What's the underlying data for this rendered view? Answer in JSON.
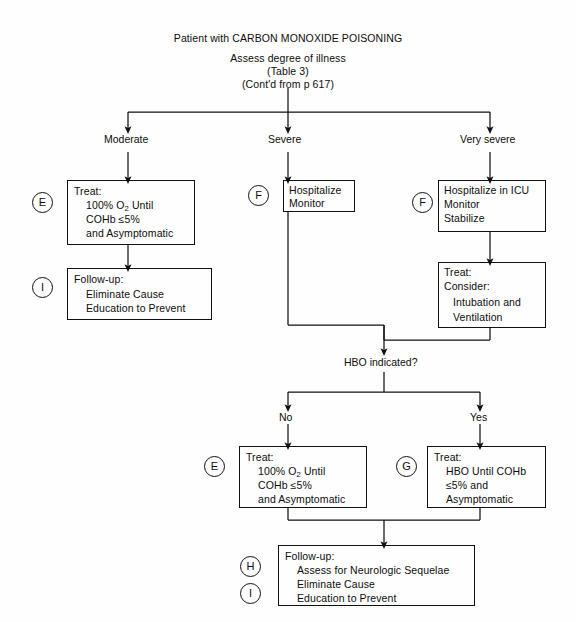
{
  "diagram": {
    "title": "Patient with CARBON MONOXIDE POISONING",
    "subtitle_1": "Assess degree of illness",
    "subtitle_2": "(Table 3)",
    "subtitle_3": "(Cont'd from p 617)"
  },
  "branch_labels": {
    "moderate": "Moderate",
    "severe": "Severe",
    "very_severe": "Very severe"
  },
  "decision": {
    "hbo": "HBO indicated?",
    "no": "No",
    "yes": "Yes"
  },
  "markers": {
    "e_top": "E",
    "i_top": "I",
    "f_severe": "F",
    "f_very_severe": "F",
    "e_bottom": "E",
    "g_bottom": "G",
    "h_final": "H",
    "i_final": "I"
  },
  "boxes": {
    "treat_moderate": {
      "line1": "Treat:",
      "line2": "100% O2 Until",
      "line2_pre": "100% O",
      "line2_sub": "2",
      "line2_post": " Until",
      "line3": "COHb ≤5%",
      "line4": "and Asymptomatic"
    },
    "followup_moderate": {
      "line1": "Follow-up:",
      "line2": "Eliminate Cause",
      "line3": "Education to Prevent"
    },
    "hospitalize_severe": {
      "line1": "Hospitalize",
      "line2": "Monitor"
    },
    "hospitalize_icu": {
      "line1": "Hospitalize in ICU",
      "line2": "Monitor",
      "line3": "Stabilize"
    },
    "treat_consider": {
      "line1": "Treat:",
      "line2": "Consider:",
      "line3": "Intubation and",
      "line4": "Ventilation"
    },
    "treat_no_hbo": {
      "line1": "Treat:",
      "line2_pre": "100% O",
      "line2_sub": "2",
      "line2_post": " Until",
      "line3": "COHb ≤5%",
      "line4": "and Asymptomatic"
    },
    "treat_hbo": {
      "line1": "Treat:",
      "line2": "HBO Until COHb",
      "line3": "≤5% and",
      "line4": "Asymptomatic"
    },
    "followup_final": {
      "line1": "Follow-up:",
      "line2": "Assess for Neurologic Sequelae",
      "line3": "Eliminate Cause",
      "line4": "Education to Prevent"
    }
  }
}
